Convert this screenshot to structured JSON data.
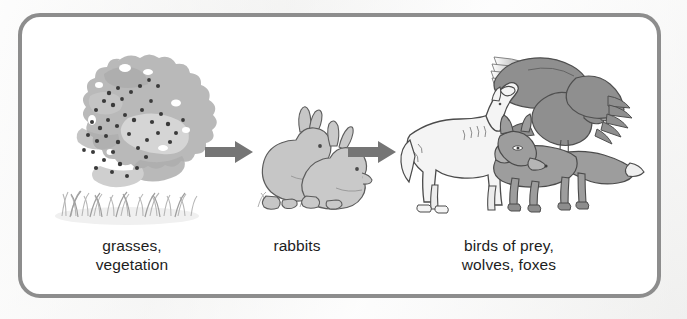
{
  "diagram": {
    "type": "food-chain",
    "background_color": "#f2f2f1",
    "panel_color": "#ffffff",
    "border_color": "#8d8d8d",
    "text_color": "#1d1d1d",
    "arrow_color": "#757575",
    "stages": [
      {
        "id": "producers",
        "label_line1": "grasses,",
        "label_line2": "vegetation",
        "illustration": "bush-with-berries-and-grass",
        "organisms": [
          "grasses",
          "vegetation"
        ]
      },
      {
        "id": "primary-consumers",
        "label_line1": "rabbits",
        "label_line2": "",
        "illustration": "two-rabbits",
        "organisms": [
          "rabbits"
        ]
      },
      {
        "id": "predators",
        "label_line1": "birds of prey,",
        "label_line2": "wolves, foxes",
        "illustration": "eagle-wolf-fox",
        "organisms": [
          "birds of prey",
          "wolves",
          "foxes"
        ]
      }
    ],
    "arrows": [
      {
        "id": "arrow-1",
        "from": "producers",
        "to": "primary-consumers",
        "direction": "right"
      },
      {
        "id": "arrow-2",
        "from": "primary-consumers",
        "to": "predators",
        "direction": "right"
      }
    ]
  }
}
